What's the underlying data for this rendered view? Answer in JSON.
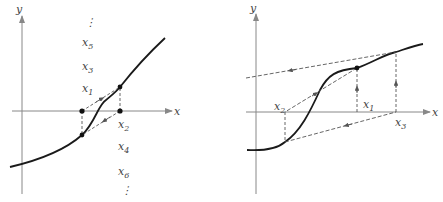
{
  "left_panel": {
    "axis_x_label": "x",
    "axis_y_label": "y",
    "labels": {
      "x5": {
        "base": "x",
        "sub": "5"
      },
      "x3": {
        "base": "x",
        "sub": "3"
      },
      "x1": {
        "base": "x",
        "sub": "1"
      },
      "x2": {
        "base": "x",
        "sub": "2"
      },
      "x4": {
        "base": "x",
        "sub": "4"
      },
      "x6": {
        "base": "x",
        "sub": "6"
      }
    },
    "ellipsis_top": "⋮",
    "ellipsis_bottom": "⋮"
  },
  "right_panel": {
    "axis_x_label": "x",
    "axis_y_label": "y",
    "labels": {
      "x1": {
        "base": "x",
        "sub": "1"
      },
      "x2": {
        "base": "x",
        "sub": "2"
      },
      "x3": {
        "base": "x",
        "sub": "3"
      }
    }
  },
  "colors": {
    "curve": "#1a1a1a",
    "axis": "#888888",
    "dashed": "#555555",
    "text": "#444444"
  }
}
